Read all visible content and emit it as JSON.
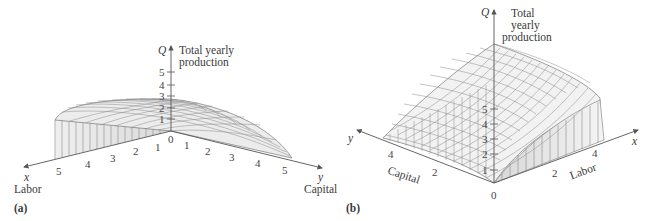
{
  "panels": [
    {
      "id": "a",
      "caption": "(a)",
      "q_axis": {
        "symbol": "Q",
        "label_line1": "Total yearly",
        "label_line2": "production",
        "ticks": [
          "1",
          "2",
          "3",
          "4",
          "5"
        ]
      },
      "x_axis": {
        "symbol": "x",
        "name": "Labor",
        "ticks": [
          "5",
          "4",
          "3",
          "2",
          "1"
        ]
      },
      "y_axis": {
        "symbol": "y",
        "name": "Capital",
        "ticks": [
          "1",
          "2",
          "3",
          "4",
          "5"
        ]
      },
      "origin_label": "0"
    },
    {
      "id": "b",
      "caption": "(b)",
      "q_axis": {
        "symbol": "Q",
        "label_line1": "Total",
        "label_line2": "yearly",
        "label_line3": "production",
        "ticks": [
          "1",
          "2",
          "3",
          "4",
          "5"
        ]
      },
      "x_axis": {
        "symbol": "x",
        "name": "Labor",
        "ticks": [
          "2",
          "4"
        ]
      },
      "y_axis": {
        "symbol": "y",
        "name": "Capital",
        "ticks": [
          "4",
          "2"
        ]
      },
      "origin_label": "0"
    }
  ],
  "colors": {
    "axis": "#555555",
    "mesh": "#7a7a7a",
    "surface_fill": "#f2f2f2",
    "side_fill": "#e4e4e4",
    "text": "#3a3a3a"
  }
}
